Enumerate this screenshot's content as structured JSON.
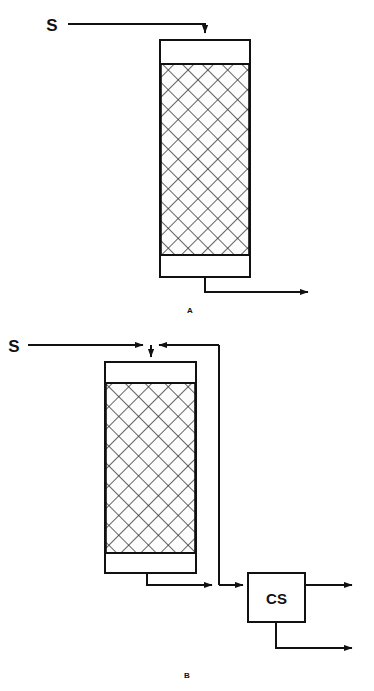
{
  "figure": {
    "background_color": "#ffffff",
    "line_color": "#111111",
    "panels": [
      {
        "id": "A",
        "label": "A",
        "label_x": 190,
        "label_y": 313,
        "description": "Single-pass packed adsorption column with feed stream S entering the top and product leaving the bottom",
        "vessel": {
          "name": "packed-column-a",
          "x": 160,
          "y": 40,
          "width": 90,
          "height": 237,
          "head_space_height": 24,
          "bottom_space_height": 22,
          "packing_fill": "cross-hatch"
        },
        "streams": [
          {
            "name": "feed-stream",
            "label": "S",
            "label_x": 52,
            "label_y": 31,
            "direction": "into-top"
          },
          {
            "name": "product-stream",
            "label": "",
            "direction": "out-bottom-right"
          }
        ]
      },
      {
        "id": "B",
        "label": "B",
        "label_x": 187,
        "label_y": 678,
        "description": "Packed adsorption column with bottom effluent sent to a CS separator unit and a recycle loop returning to the column feed point",
        "vessel": {
          "name": "packed-column-b",
          "x": 105,
          "y": 362,
          "width": 91,
          "height": 211,
          "head_space_height": 21,
          "bottom_space_height": 20,
          "packing_fill": "cross-hatch"
        },
        "unit": {
          "name": "cs-separator",
          "label": "CS",
          "x": 248,
          "y": 573,
          "width": 57,
          "height": 49
        },
        "streams": [
          {
            "name": "feed-stream",
            "label": "S",
            "label_x": 14,
            "label_y": 347,
            "direction": "into-top"
          },
          {
            "name": "recycle-stream",
            "label": "",
            "direction": "cs-inlet-to-column-top"
          },
          {
            "name": "column-bottoms-stream",
            "label": "",
            "direction": "column-bottom-to-cs"
          },
          {
            "name": "cs-overhead-product",
            "label": "",
            "direction": "out-right"
          },
          {
            "name": "cs-bottoms-product",
            "label": "",
            "direction": "out-bottom-right"
          }
        ]
      }
    ]
  }
}
